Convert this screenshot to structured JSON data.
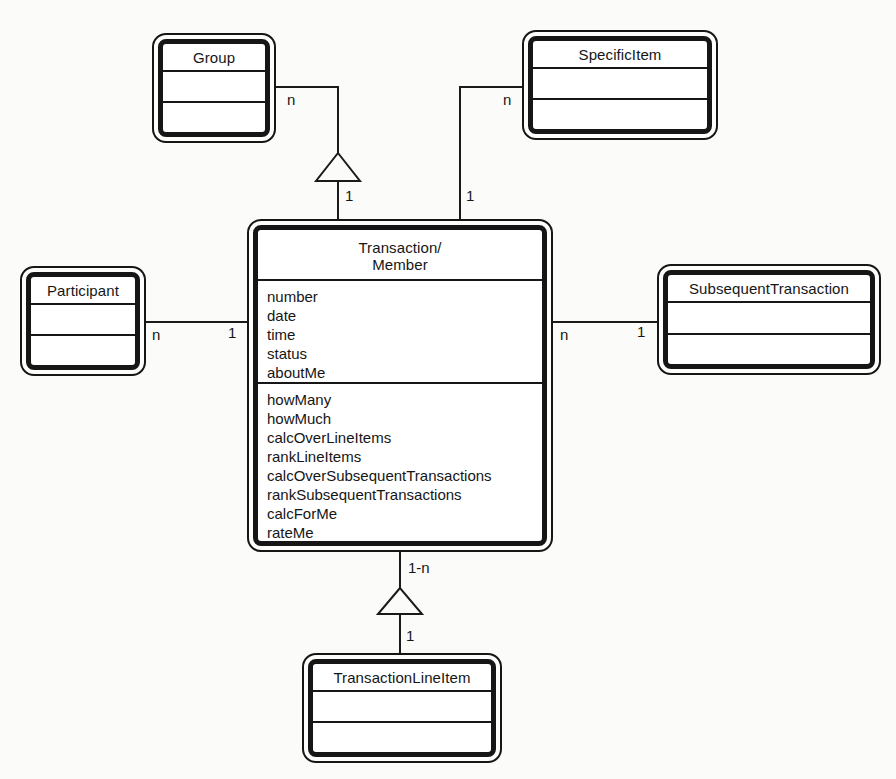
{
  "diagram_type": "class-diagram",
  "classes": {
    "group": {
      "title": "Group"
    },
    "specific_item": {
      "title": "SpecificItem"
    },
    "participant": {
      "title": "Participant"
    },
    "subsequent_transaction": {
      "title": "SubsequentTransaction"
    },
    "transaction_line_item": {
      "title": "TransactionLineItem"
    },
    "transaction_member": {
      "title_lines": [
        "Transaction/",
        "Member"
      ],
      "attributes": [
        "number",
        "date",
        "time",
        "status",
        "aboutMe"
      ],
      "operations": [
        "howMany",
        "howMuch",
        "calcOverLineItems",
        "rankLineItems",
        "calcOverSubsequentTransactions",
        "rankSubsequentTransactions",
        "calcForMe",
        "rateMe"
      ]
    }
  },
  "connections": [
    {
      "from": "Group",
      "to": "Transaction/Member",
      "from_label": "n",
      "to_label": "1",
      "style": "generalization-triangle"
    },
    {
      "from": "SpecificItem",
      "to": "Transaction/Member",
      "from_label": "n",
      "to_label": "1",
      "style": "association"
    },
    {
      "from": "Participant",
      "to": "Transaction/Member",
      "from_label": "n",
      "to_label": "1",
      "style": "association"
    },
    {
      "from": "Transaction/Member",
      "to": "SubsequentTransaction",
      "from_label": "n",
      "to_label": "1",
      "style": "association"
    },
    {
      "from": "Transaction/Member",
      "to": "TransactionLineItem",
      "from_label": "1-n",
      "to_label": "1",
      "style": "generalization-triangle"
    }
  ],
  "colors": {
    "background": "#fbfbfa",
    "line": "#1a1a1a",
    "box_fill": "#ffffff"
  }
}
